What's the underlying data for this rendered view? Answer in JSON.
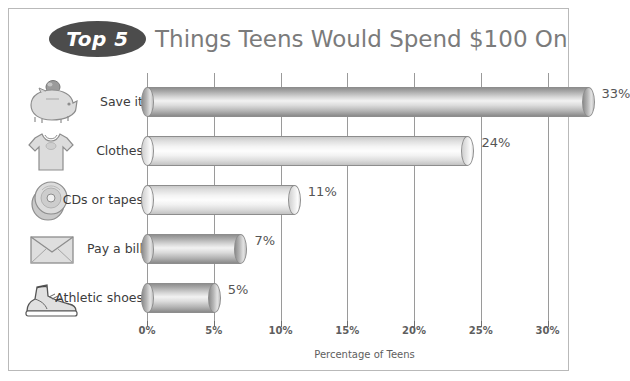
{
  "title": {
    "badge": "Top 5",
    "text": "Things Teens Would Spend $100 On"
  },
  "colors": {
    "badge_fill": "#4c4c4c",
    "badge_text": "#ffffff",
    "title_text": "#7b7b7b",
    "frame_border": "#b9b9b9",
    "gridline": "#9a9a9a",
    "bar_dark": "#b4b4b4",
    "bar_light": "#f0f0f0",
    "value_text": "#555555",
    "axis_text": "#5e5e5e"
  },
  "chart_data": {
    "type": "bar",
    "orientation": "horizontal",
    "title": "Top 5 Things Teens Would Spend $100 On",
    "xlabel": "Percentage of Teens",
    "ylabel": "",
    "xlim": [
      0,
      33
    ],
    "xticks": [
      0,
      5,
      10,
      15,
      20,
      25,
      30
    ],
    "xtick_labels": [
      "0%",
      "5%",
      "10%",
      "15%",
      "20%",
      "25%",
      "30%"
    ],
    "grid": true,
    "legend": false,
    "categories": [
      "Save it",
      "Clothes",
      "CDs or tapes",
      "Pay a bill",
      "Athletic shoes"
    ],
    "values": [
      33,
      24,
      11,
      7,
      5
    ],
    "data_labels": [
      "33%",
      "24%",
      "11%",
      "7%",
      "5%"
    ]
  },
  "rows": [
    {
      "label": "Save it",
      "value": 33,
      "value_label": "33%",
      "icon": "piggy-bank-icon",
      "shade": "dark"
    },
    {
      "label": "Clothes",
      "value": 24,
      "value_label": "24%",
      "icon": "t-shirt-icon",
      "shade": "light"
    },
    {
      "label": "CDs or tapes",
      "value": 11,
      "value_label": "11%",
      "icon": "compact-disc-icon",
      "shade": "light"
    },
    {
      "label": "Pay a bill",
      "value": 7,
      "value_label": "7%",
      "icon": "envelope-icon",
      "shade": "dark"
    },
    {
      "label": "Athletic shoes",
      "value": 5,
      "value_label": "5%",
      "icon": "sneaker-icon",
      "shade": "dark"
    }
  ],
  "axis": {
    "title": "Percentage of Teens",
    "ticks": [
      "0%",
      "5%",
      "10%",
      "15%",
      "20%",
      "25%",
      "30%"
    ]
  }
}
